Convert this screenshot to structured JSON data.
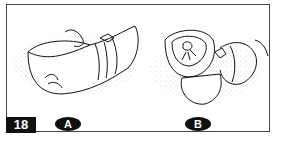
{
  "figure": {
    "number": "18",
    "panels": [
      {
        "label": "A",
        "description": "wrapped bundle tied with cords, viewed from side"
      },
      {
        "label": "B",
        "description": "wrapped bundle tied with cords, viewed from front"
      }
    ]
  }
}
